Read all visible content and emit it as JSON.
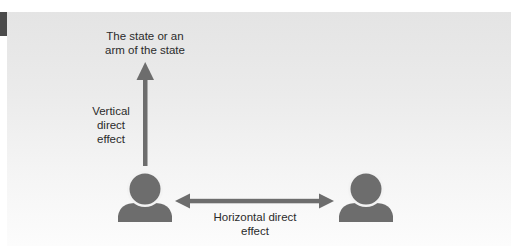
{
  "diagram": {
    "type": "direct-effect-relationships",
    "colors": {
      "shape": "#6d6d6d",
      "text": "#2b2b2b",
      "panel_top": "#e4e4e4",
      "panel_bottom": "#fcfcfc",
      "tab_marker": "#4a4a4a"
    },
    "nodes": {
      "state": {
        "line1": "The state or an",
        "line2": "arm of the state"
      },
      "person_left": {
        "icon": "person-icon"
      },
      "person_right": {
        "icon": "person-icon"
      }
    },
    "edges": {
      "vertical": {
        "from": "person_left",
        "to": "state",
        "direction": "one-way",
        "label_line1": "Vertical",
        "label_line2": "direct",
        "label_line3": "effect"
      },
      "horizontal": {
        "from": "person_left",
        "to": "person_right",
        "direction": "two-way",
        "label_line1": "Horizontal direct",
        "label_line2": "effect"
      }
    }
  }
}
